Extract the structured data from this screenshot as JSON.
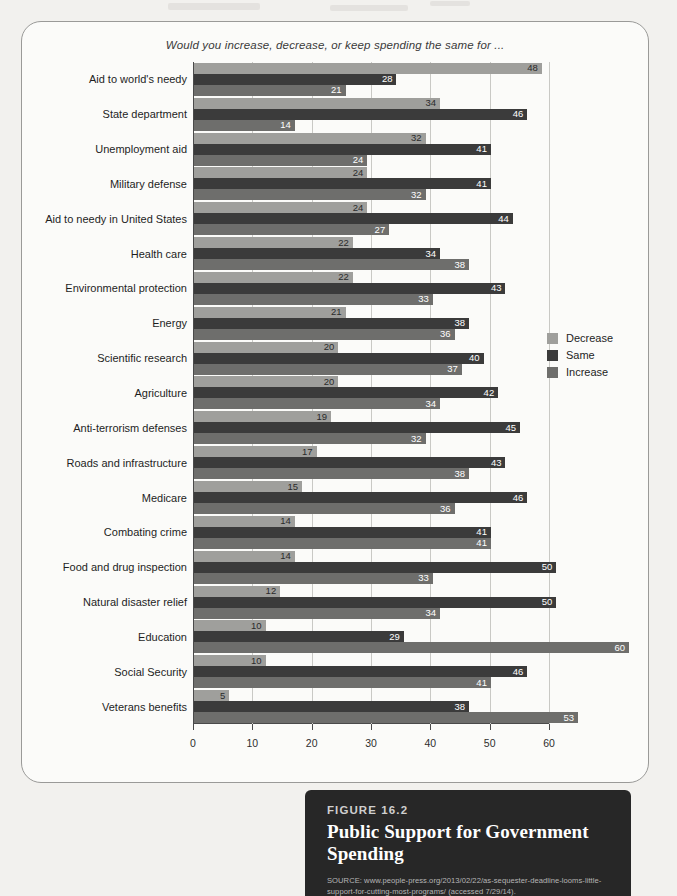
{
  "figure": {
    "number_label": "FIGURE 16.2",
    "title": "Public Support for Government Spending",
    "source": "SOURCE: www.people-press.org/2013/02/22/as-sequester-deadline-looms-little-support-for-cutting-most-programs/ (accessed 7/29/14)."
  },
  "colors": {
    "decrease": "#9f9f9c",
    "same": "#3b3b3b",
    "increase": "#6e6e6c",
    "card_background": "#272727",
    "panel_background": "#fbfbf9",
    "page_background": "#f2f1ee"
  },
  "chart_data": {
    "type": "bar",
    "orientation": "horizontal",
    "title": "Would you increase, decrease, or keep spending the same for ...",
    "xlabel": "",
    "ylabel": "",
    "xlim": [
      0,
      60
    ],
    "xticks": [
      0,
      10,
      20,
      30,
      40,
      50,
      60
    ],
    "xtick_labels": [
      "0",
      "10",
      "20",
      "30",
      "40",
      "50",
      "60"
    ],
    "grid": true,
    "legend_position": "right",
    "legend": [
      "Decrease",
      "Same",
      "Increase"
    ],
    "categories": [
      "Aid to world's needy",
      "State department",
      "Unemployment aid",
      "Military defense",
      "Aid to needy in United States",
      "Health care",
      "Environmental protection",
      "Energy",
      "Scientific research",
      "Agriculture",
      "Anti-terrorism defenses",
      "Roads and infrastructure",
      "Medicare",
      "Combating crime",
      "Food and drug inspection",
      "Natural disaster relief",
      "Education",
      "Social Security",
      "Veterans benefits"
    ],
    "series": [
      {
        "name": "Decrease",
        "color": "#9f9f9c",
        "values": [
          48,
          34,
          32,
          24,
          24,
          22,
          22,
          21,
          20,
          20,
          19,
          17,
          15,
          14,
          14,
          12,
          10,
          10,
          5
        ]
      },
      {
        "name": "Same",
        "color": "#3b3b3b",
        "values": [
          28,
          46,
          41,
          41,
          44,
          34,
          43,
          38,
          40,
          42,
          45,
          43,
          46,
          41,
          50,
          50,
          29,
          46,
          38
        ]
      },
      {
        "name": "Increase",
        "color": "#6e6e6c",
        "values": [
          21,
          14,
          24,
          32,
          27,
          38,
          33,
          36,
          37,
          34,
          32,
          38,
          36,
          41,
          33,
          34,
          60,
          41,
          53
        ]
      }
    ]
  }
}
